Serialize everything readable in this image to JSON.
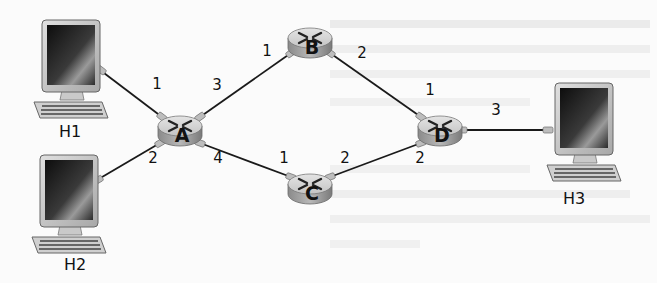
{
  "diagram": {
    "type": "network-topology",
    "colors": {
      "link": "#1a1a1a",
      "router_top": "#d6d6d6",
      "router_side": "#9a9a9a",
      "router_mark": "#222222",
      "port": "#b5b5b5",
      "monitor_frame": "#c8c8c8",
      "screen_dark": "#1e1e1e",
      "label": "#111111",
      "background": "#fbfbfb"
    },
    "hosts": [
      {
        "id": "H1",
        "label": "H1",
        "x": 75,
        "y": 65,
        "label_x": 70,
        "label_y": 137
      },
      {
        "id": "H2",
        "label": "H2",
        "x": 72,
        "y": 197,
        "label_x": 75,
        "label_y": 270
      },
      {
        "id": "H3",
        "label": "H3",
        "x": 585,
        "y": 122,
        "label_x": 574,
        "label_y": 204
      }
    ],
    "routers": [
      {
        "id": "A",
        "label": "A",
        "x": 180,
        "y": 130
      },
      {
        "id": "B",
        "label": "B",
        "x": 310,
        "y": 40
      },
      {
        "id": "C",
        "label": "C",
        "x": 310,
        "y": 188
      },
      {
        "id": "D",
        "label": "D",
        "x": 440,
        "y": 130
      }
    ],
    "links": [
      {
        "from": "H1",
        "to": "A",
        "x1": 100,
        "y1": 70,
        "x2": 162,
        "y2": 117
      },
      {
        "from": "H2",
        "to": "A",
        "x1": 97,
        "y1": 180,
        "x2": 160,
        "y2": 143
      },
      {
        "from": "A",
        "to": "B",
        "x1": 200,
        "y1": 117,
        "x2": 291,
        "y2": 55
      },
      {
        "from": "A",
        "to": "C",
        "x1": 200,
        "y1": 143,
        "x2": 291,
        "y2": 175
      },
      {
        "from": "B",
        "to": "D",
        "x1": 330,
        "y1": 55,
        "x2": 421,
        "y2": 117
      },
      {
        "from": "C",
        "to": "D",
        "x1": 330,
        "y1": 175,
        "x2": 421,
        "y2": 143
      },
      {
        "from": "D",
        "to": "H3",
        "x1": 462,
        "y1": 130,
        "x2": 548,
        "y2": 130
      }
    ],
    "interfaces": [
      {
        "router": "A",
        "port": "1",
        "x": 157,
        "y": 89
      },
      {
        "router": "A",
        "port": "3",
        "x": 217,
        "y": 90
      },
      {
        "router": "A",
        "port": "2",
        "x": 153,
        "y": 163
      },
      {
        "router": "A",
        "port": "4",
        "x": 218,
        "y": 163
      },
      {
        "router": "B",
        "port": "1",
        "x": 267,
        "y": 56
      },
      {
        "router": "B",
        "port": "2",
        "x": 362,
        "y": 58
      },
      {
        "router": "C",
        "port": "1",
        "x": 284,
        "y": 163
      },
      {
        "router": "C",
        "port": "2",
        "x": 345,
        "y": 163
      },
      {
        "router": "D",
        "port": "1",
        "x": 430,
        "y": 95
      },
      {
        "router": "D",
        "port": "3",
        "x": 496,
        "y": 115
      },
      {
        "router": "D",
        "port": "2",
        "x": 420,
        "y": 163
      }
    ]
  },
  "labels": {
    "H1": "H1",
    "H2": "H2",
    "H3": "H3",
    "A": "A",
    "B": "B",
    "C": "C",
    "D": "D",
    "A1": "1",
    "A2": "2",
    "A3": "3",
    "A4": "4",
    "B1": "1",
    "B2": "2",
    "C1": "1",
    "C2": "2",
    "D1": "1",
    "D2": "2",
    "D3": "3"
  }
}
